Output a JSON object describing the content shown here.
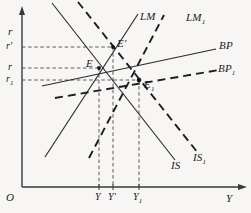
{
  "figure": {
    "type": "economics-diagram",
    "model": "IS-LM-BP",
    "background_color": "#f7f6f4",
    "ink_color": "#1a1a1a"
  },
  "axes": {
    "y_axis_label": "r",
    "x_axis_label": "Y",
    "origin_label": "O",
    "y_ticks": [
      {
        "label": "r′",
        "y_px": 47
      },
      {
        "label": "r",
        "y_px": 68
      },
      {
        "label": "r",
        "sub": "1",
        "y_px": 80
      }
    ],
    "x_ticks": [
      {
        "label": "Y",
        "x_px": 99
      },
      {
        "label": "Y′",
        "x_px": 113
      },
      {
        "label": "Y",
        "sub": "1",
        "x_px": 139
      }
    ]
  },
  "curves": [
    {
      "name": "LM",
      "label": "LM",
      "style": "solid",
      "slope": "upward"
    },
    {
      "name": "LM1",
      "label": "LM",
      "sub": "1",
      "style": "dashed",
      "slope": "upward"
    },
    {
      "name": "IS",
      "label": "IS",
      "style": "solid",
      "slope": "downward"
    },
    {
      "name": "IS1",
      "label": "IS",
      "sub": "1",
      "style": "dashed",
      "slope": "downward"
    },
    {
      "name": "BP",
      "label": "BP",
      "style": "solid",
      "slope": "upward-shallow"
    },
    {
      "name": "BP1",
      "label": "BP",
      "sub": "1",
      "style": "dashed",
      "slope": "upward-shallow"
    }
  ],
  "points": [
    {
      "name": "E",
      "label": "E",
      "x_px": 99,
      "y_px": 68
    },
    {
      "name": "E'",
      "label": "E′",
      "x_px": 113,
      "y_px": 47
    },
    {
      "name": "E1",
      "label": "E",
      "sub": "1",
      "x_px": 139,
      "y_px": 80
    }
  ],
  "labels": {
    "lm": "LM",
    "lm1_base": "LM",
    "lm1_sub": "1",
    "is": "IS",
    "is1_base": "IS",
    "is1_sub": "1",
    "bp": "BP",
    "bp1_base": "BP",
    "bp1_sub": "1",
    "e": "E",
    "e_prime": "E′",
    "e1_base": "E",
    "e1_sub": "1",
    "origin": "O",
    "axis_r": "r",
    "axis_y": "Y",
    "tick_r_prime": "r′",
    "tick_r": "r",
    "tick_r1_base": "r",
    "tick_r1_sub": "1",
    "tick_Y": "Y",
    "tick_Y_prime": "Y′",
    "tick_Y1_base": "Y",
    "tick_Y1_sub": "1"
  }
}
